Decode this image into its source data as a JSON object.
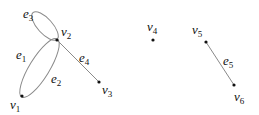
{
  "diagram": {
    "type": "graph",
    "vertices": [
      {
        "id": "v1",
        "base": "v",
        "sub": "1",
        "x": 22,
        "y": 96,
        "label_x": 10,
        "label_y": 109
      },
      {
        "id": "v2",
        "base": "v",
        "sub": "2",
        "x": 57,
        "y": 40,
        "label_x": 61,
        "label_y": 37
      },
      {
        "id": "v3",
        "base": "v",
        "sub": "3",
        "x": 99,
        "y": 82,
        "label_x": 102,
        "label_y": 95
      },
      {
        "id": "v4",
        "base": "v",
        "sub": "4",
        "x": 153,
        "y": 40,
        "label_x": 147,
        "label_y": 32
      },
      {
        "id": "v5",
        "base": "v",
        "sub": "5",
        "x": 206,
        "y": 42,
        "label_x": 192,
        "label_y": 36
      },
      {
        "id": "v6",
        "base": "v",
        "sub": "6",
        "x": 234,
        "y": 85,
        "label_x": 234,
        "label_y": 102
      }
    ],
    "edges": [
      {
        "id": "e1",
        "base": "e",
        "sub": "1",
        "from": "v1",
        "to": "v2",
        "label_x": 17,
        "label_y": 60
      },
      {
        "id": "e2",
        "base": "e",
        "sub": "2",
        "from": "v1",
        "to": "v2",
        "label_x": 52,
        "label_y": 84
      },
      {
        "id": "e3",
        "base": "e",
        "sub": "3",
        "from": "v2",
        "to": "v2",
        "loop": true,
        "label_x": 24,
        "label_y": 19
      },
      {
        "id": "e4",
        "base": "e",
        "sub": "4",
        "from": "v2",
        "to": "v3",
        "label_x": 80,
        "label_y": 63
      },
      {
        "id": "e5",
        "base": "e",
        "sub": "5",
        "from": "v5",
        "to": "v6",
        "label_x": 224,
        "label_y": 66
      }
    ],
    "colors": {
      "edge": "#8a8a8a",
      "vertex": "#111111",
      "text": "#111111"
    }
  },
  "labels": {
    "v1": {
      "base": "v",
      "sub": "1"
    },
    "v2": {
      "base": "v",
      "sub": "2"
    },
    "v3": {
      "base": "v",
      "sub": "3"
    },
    "v4": {
      "base": "v",
      "sub": "4"
    },
    "v5": {
      "base": "v",
      "sub": "5"
    },
    "v6": {
      "base": "v",
      "sub": "6"
    },
    "e1": {
      "base": "e",
      "sub": "1"
    },
    "e2": {
      "base": "e",
      "sub": "2"
    },
    "e3": {
      "base": "e",
      "sub": "3"
    },
    "e4": {
      "base": "e",
      "sub": "4"
    },
    "e5": {
      "base": "e",
      "sub": "5"
    }
  }
}
